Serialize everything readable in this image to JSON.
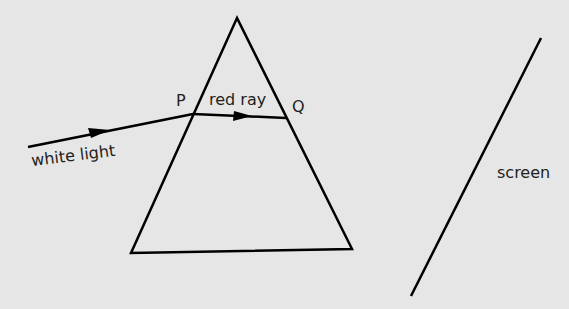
{
  "diagram": {
    "background_color": "#e6e6e6",
    "line_color": "#000000",
    "labels": {
      "incident": "white light",
      "point_p": "P",
      "refracted": "red ray",
      "point_q": "Q",
      "screen": "screen"
    },
    "shapes": {
      "prism": {
        "apex": [
          237,
          18
        ],
        "bottom_left": [
          131,
          253
        ],
        "bottom_right": [
          352,
          249
        ]
      },
      "incident_ray": {
        "from": [
          28,
          147
        ],
        "to": [
          193,
          114
        ]
      },
      "red_ray": {
        "from": [
          193,
          114
        ],
        "to": [
          286,
          118
        ]
      },
      "screen_line": {
        "from": [
          541,
          38
        ],
        "to": [
          411,
          296
        ]
      }
    }
  }
}
